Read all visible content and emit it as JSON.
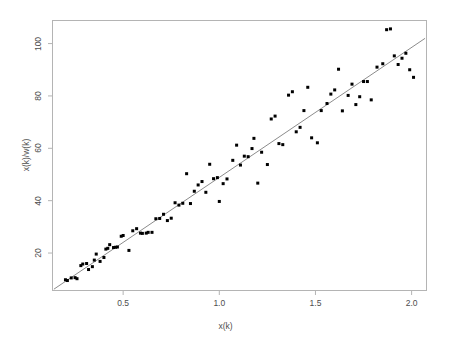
{
  "chart_data": {
    "type": "scatter",
    "title": "",
    "xlabel": "x(k)",
    "ylabel": "x(k)/w(k)",
    "xlim": [
      0.13,
      2.08
    ],
    "ylim": [
      5.5,
      109.0
    ],
    "grid": false,
    "legend": null,
    "xticks": [
      0.5,
      1.0,
      1.5,
      2.0
    ],
    "xtick_labels": [
      "0.5",
      "1.0",
      "1.5",
      "2.0"
    ],
    "yticks": [
      20,
      40,
      60,
      80,
      100
    ],
    "ytick_labels": [
      "20",
      "40",
      "60",
      "80",
      "100"
    ],
    "marker": {
      "shape": "square",
      "size_px": 3,
      "color": "#000000"
    },
    "fit_line": {
      "type": "linear",
      "color": "#8c8c8c",
      "width_px": 1,
      "x_start": 0.14,
      "y_start": 6.2,
      "x_end": 2.07,
      "y_end": 102.0,
      "slope": 49.6,
      "intercept": -0.75
    },
    "x": [
      0.2,
      0.21,
      0.23,
      0.25,
      0.26,
      0.28,
      0.29,
      0.31,
      0.32,
      0.34,
      0.35,
      0.36,
      0.38,
      0.4,
      0.41,
      0.42,
      0.43,
      0.45,
      0.46,
      0.47,
      0.49,
      0.5,
      0.53,
      0.55,
      0.57,
      0.59,
      0.6,
      0.62,
      0.63,
      0.65,
      0.67,
      0.69,
      0.71,
      0.73,
      0.75,
      0.77,
      0.79,
      0.81,
      0.83,
      0.85,
      0.87,
      0.89,
      0.91,
      0.93,
      0.95,
      0.97,
      0.99,
      1.0,
      1.02,
      1.04,
      1.07,
      1.09,
      1.11,
      1.13,
      1.15,
      1.17,
      1.18,
      1.2,
      1.22,
      1.25,
      1.27,
      1.29,
      1.31,
      1.33,
      1.36,
      1.38,
      1.4,
      1.42,
      1.44,
      1.46,
      1.48,
      1.51,
      1.53,
      1.56,
      1.58,
      1.6,
      1.62,
      1.64,
      1.67,
      1.69,
      1.71,
      1.73,
      1.75,
      1.77,
      1.79,
      1.82,
      1.85,
      1.87,
      1.89,
      1.91,
      1.93,
      1.95,
      1.97,
      1.99,
      2.01
    ],
    "y": [
      9.8,
      9.5,
      10.5,
      10.6,
      10.2,
      15.2,
      15.8,
      16.0,
      13.7,
      14.8,
      17.3,
      19.6,
      16.8,
      18.3,
      21.5,
      21.8,
      23.2,
      22.1,
      22.2,
      22.3,
      26.4,
      26.7,
      21.0,
      28.5,
      29.3,
      27.6,
      27.5,
      27.6,
      27.9,
      27.9,
      33.1,
      33.2,
      34.8,
      32.4,
      33.3,
      39.2,
      38.3,
      39.0,
      50.3,
      38.9,
      43.6,
      46.0,
      47.3,
      43.2,
      53.9,
      48.4,
      48.8,
      39.7,
      46.5,
      48.3,
      55.4,
      61.2,
      53.6,
      57.0,
      56.8,
      59.9,
      63.8,
      46.7,
      58.5,
      53.8,
      71.2,
      72.3,
      61.8,
      61.4,
      80.3,
      81.6,
      66.3,
      68.0,
      74.4,
      83.3,
      64.0,
      62.1,
      74.4,
      77.1,
      80.7,
      82.3,
      90.2,
      74.3,
      80.2,
      84.5,
      76.7,
      79.7,
      85.5,
      85.5,
      78.5,
      91.0,
      92.3,
      105.3,
      105.6,
      95.3,
      92.0,
      94.4,
      96.3,
      90.0,
      87.1
    ]
  }
}
